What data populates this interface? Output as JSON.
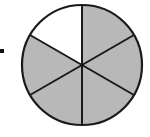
{
  "figure": {
    "type": "fraction-circle",
    "total_parts": 6,
    "shaded_parts": 5,
    "unshaded_sector_indices": [
      5
    ],
    "colors": {
      "shaded": "#b8b8b8",
      "unshaded": "#ffffff",
      "stroke": "#1a1a1a"
    },
    "geometry": {
      "cx": 82,
      "cy": 65,
      "r": 60
    }
  },
  "marker": {
    "symbol": "bullet"
  }
}
